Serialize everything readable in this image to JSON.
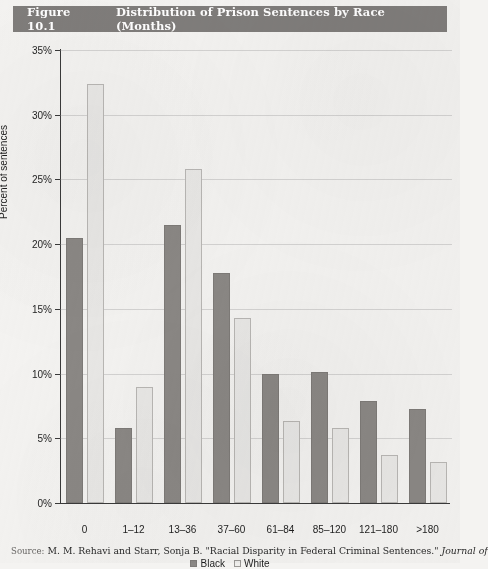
{
  "figure": {
    "number": "Figure 10.1",
    "title": "Distribution of Prison Sentences by Race (Months)",
    "title_bar_color": "#807d7b"
  },
  "source_note": {
    "label": "Source:",
    "text": "M. M. Rehavi and Starr, Sonja B. \"Racial Disparity in Federal Criminal Sentences.\"",
    "italic_tail": "Journal of"
  },
  "legend": {
    "items": [
      {
        "label": "Black",
        "color": "#8b8885"
      },
      {
        "label": "White",
        "color": "#e9e8e6"
      }
    ]
  },
  "chart_data": {
    "type": "bar",
    "title": "Distribution of Prison Sentences by Race (Months)",
    "xlabel": "",
    "ylabel": "Percent of sentences",
    "ylim": [
      0,
      35
    ],
    "ytick_labels": [
      "0%",
      "5%",
      "10%",
      "15%",
      "20%",
      "25%",
      "30%",
      "35%"
    ],
    "ytick_values": [
      0,
      5,
      10,
      15,
      20,
      25,
      30,
      35
    ],
    "grid": true,
    "legend_position": "bottom-center",
    "categories": [
      "0",
      "1–12",
      "13–36",
      "37–60",
      "61–84",
      "85–120",
      "121–180",
      ">180"
    ],
    "series": [
      {
        "name": "Black",
        "color": "#8b8885",
        "values": [
          20.5,
          5.8,
          21.5,
          17.8,
          10.0,
          10.1,
          7.9,
          7.3
        ]
      },
      {
        "name": "White",
        "color": "#e9e8e6",
        "values": [
          32.4,
          9.0,
          25.8,
          14.3,
          6.3,
          5.8,
          3.7,
          3.2
        ]
      }
    ]
  }
}
